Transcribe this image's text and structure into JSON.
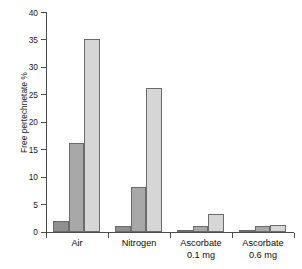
{
  "chart_data": {
    "type": "bar",
    "title": "",
    "xlabel": "",
    "ylabel": "Free pertechnetate %",
    "ylim": [
      0,
      40
    ],
    "yticks": [
      0,
      5,
      10,
      15,
      20,
      25,
      30,
      35,
      40
    ],
    "ytick_labels": [
      "0",
      "5",
      "10",
      "15",
      "20",
      "25",
      "30",
      "35",
      "40"
    ],
    "grid": false,
    "legend": "none",
    "categories": [
      "Air",
      "Nitrogen",
      "Ascorbate 0.1 mg",
      "Ascorbate 0.6 mg"
    ],
    "category_lines": [
      [
        "Air",
        ""
      ],
      [
        "Nitrogen",
        ""
      ],
      [
        "Ascorbate",
        "0.1 mg"
      ],
      [
        "Ascorbate",
        "0.6 mg"
      ]
    ],
    "series": [
      {
        "name": "series-1",
        "color": "#8f8f8f",
        "values": [
          2.0,
          1.1,
          0.3,
          0.3
        ]
      },
      {
        "name": "series-2",
        "color": "#a8a8a8",
        "values": [
          16.1,
          8.2,
          1.1,
          1.0
        ]
      },
      {
        "name": "series-3",
        "color": "#d6d6d6",
        "values": [
          35.0,
          26.1,
          3.2,
          1.2
        ]
      }
    ],
    "bar_edge_color": "#6b6b6b",
    "axis_color": "#4d4d4d",
    "text_color": "#1a1a1a",
    "background_color": "#ffffff"
  }
}
